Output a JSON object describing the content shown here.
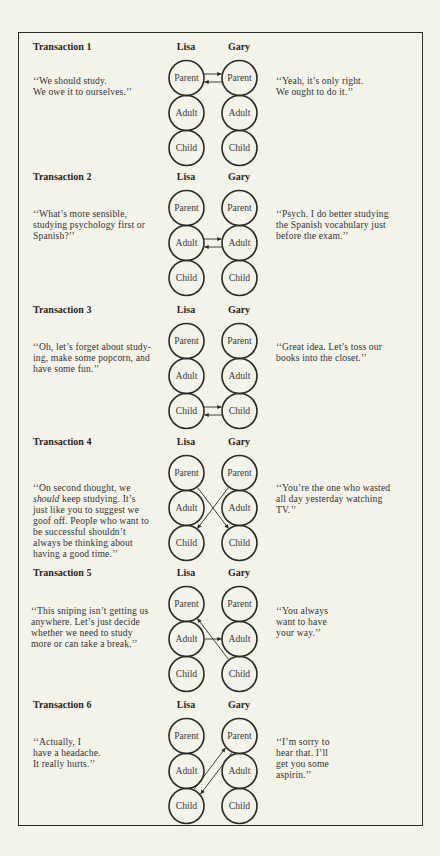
{
  "figure": {
    "participants": [
      "Lisa",
      "Gary"
    ],
    "ego_states": [
      "Parent",
      "Adult",
      "Child"
    ],
    "transactions": [
      {
        "title": "Transaction 1",
        "lisa_quote": [
          "‘‘We should study.",
          "We owe it to ourselves.’’"
        ],
        "gary_quote": [
          "‘‘Yeah, it’s only right.",
          "We ought to do it.’’"
        ],
        "arrows": [
          {
            "from": [
              "Lisa",
              "Parent"
            ],
            "to": [
              "Gary",
              "Parent"
            ]
          },
          {
            "from": [
              "Gary",
              "Parent"
            ],
            "to": [
              "Lisa",
              "Parent"
            ]
          }
        ]
      },
      {
        "title": "Transaction 2",
        "lisa_quote": [
          "‘‘What’s more sensible,",
          "studying psychology first or",
          "Spanish?’’"
        ],
        "gary_quote": [
          "‘‘Psych. I do better studying",
          "the Spanish vocabulary just",
          "before the exam.’’"
        ],
        "arrows": [
          {
            "from": [
              "Lisa",
              "Adult"
            ],
            "to": [
              "Gary",
              "Adult"
            ]
          },
          {
            "from": [
              "Gary",
              "Adult"
            ],
            "to": [
              "Lisa",
              "Adult"
            ]
          }
        ]
      },
      {
        "title": "Transaction 3",
        "lisa_quote": [
          "‘‘Oh, let’s forget about study-",
          "ing, make some popcorn, and",
          "have some fun.’’"
        ],
        "gary_quote": [
          "‘‘Great idea. Let’s toss our",
          "books into the closet.’’"
        ],
        "arrows": [
          {
            "from": [
              "Lisa",
              "Child"
            ],
            "to": [
              "Gary",
              "Child"
            ]
          },
          {
            "from": [
              "Gary",
              "Child"
            ],
            "to": [
              "Lisa",
              "Child"
            ]
          }
        ]
      },
      {
        "title": "Transaction 4",
        "lisa_quote": [
          "‘‘On second thought, we",
          {
            "emphasis": "should",
            "text": " keep studying. It’s"
          },
          "just like you to suggest we",
          "goof off. People who want to",
          "be successful shouldn’t",
          "always be thinking about",
          "having a good time.’’"
        ],
        "gary_quote": [
          "‘‘You’re the one who wasted",
          "all day yesterday watching",
          "TV.’’"
        ],
        "arrows": [
          {
            "from": [
              "Lisa",
              "Parent"
            ],
            "to": [
              "Gary",
              "Child"
            ]
          },
          {
            "from": [
              "Gary",
              "Parent"
            ],
            "to": [
              "Lisa",
              "Child"
            ]
          }
        ]
      },
      {
        "title": "Transaction 5",
        "lisa_quote": [
          "‘‘This sniping isn’t getting us",
          "anywhere. Let’s just decide",
          "whether we need to study",
          "more or can take a break.’’"
        ],
        "gary_quote": [
          "‘‘You always",
          "want to have",
          "your way.’’"
        ],
        "arrows": [
          {
            "from": [
              "Lisa",
              "Adult"
            ],
            "to": [
              "Gary",
              "Adult"
            ]
          },
          {
            "from": [
              "Gary",
              "Child"
            ],
            "to": [
              "Lisa",
              "Parent"
            ]
          }
        ]
      },
      {
        "title": "Transaction 6",
        "lisa_quote": [
          "‘‘Actually, I",
          "have a headache.",
          "It really hurts.’’"
        ],
        "gary_quote": [
          "‘‘I’m sorry to",
          "hear that. I’ll",
          "get you some",
          "aspirin.’’"
        ],
        "arrows": [
          {
            "from": [
              "Lisa",
              "Child"
            ],
            "to": [
              "Gary",
              "Parent"
            ]
          },
          {
            "from": [
              "Gary",
              "Parent"
            ],
            "to": [
              "Lisa",
              "Child"
            ]
          }
        ]
      }
    ]
  },
  "colors": {
    "background": "#f4f3ea",
    "ink": "#2b2b2b",
    "frame": "#2a2a2a"
  }
}
